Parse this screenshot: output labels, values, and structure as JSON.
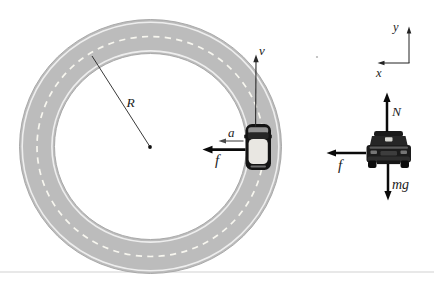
{
  "figure": {
    "bg_color": "#ffffff",
    "track": {
      "road_color": "#bcbcbc",
      "edge_color": "#a3a3a3",
      "dash_color": "#f7f6ef",
      "radius_label": "R"
    },
    "track_car": {
      "velocity_label": "v",
      "acceleration_label": "a",
      "friction_label": "f"
    },
    "axes": {
      "x_label": "x",
      "y_label": "y"
    },
    "fbd": {
      "normal_label": "N",
      "friction_label": "f",
      "weight_label": "mg"
    }
  }
}
